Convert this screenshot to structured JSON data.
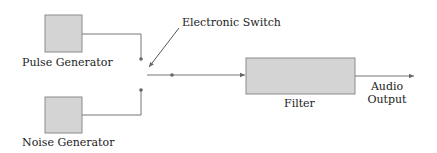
{
  "diagram": {
    "type": "block-diagram",
    "blocks": [
      {
        "id": "pulse",
        "label": "Pulse Generator"
      },
      {
        "id": "noise",
        "label": "Noise Generator"
      },
      {
        "id": "filter",
        "label": "Filter"
      }
    ],
    "annotations": {
      "switch_label": "Electronic Switch",
      "output_label_line1": "Audio",
      "output_label_line2": "Output"
    },
    "colors": {
      "block_fill": "#d4d4d4",
      "block_stroke": "#8c8c8c",
      "line": "#777777"
    }
  }
}
